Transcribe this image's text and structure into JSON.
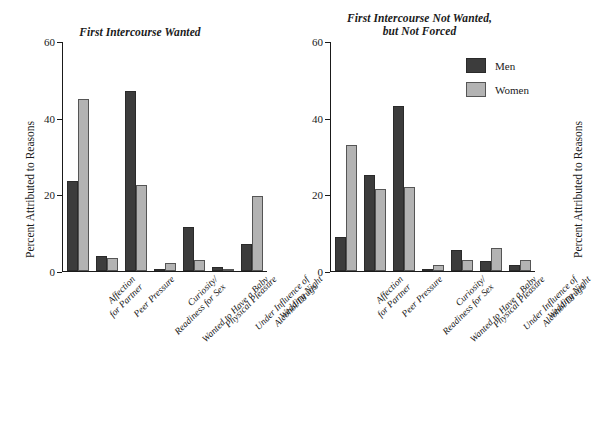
{
  "figure": {
    "y_axis_label": "Percent Attributed to Reasons",
    "legend": {
      "men_label": "Men",
      "women_label": "Women",
      "men_color": "#3c3c3c",
      "women_color": "#b3b3b3"
    }
  },
  "chart_data": [
    {
      "type": "bar",
      "title": "First Intercourse Wanted",
      "xlabel": "",
      "ylabel": "Percent Attributed to Reasons",
      "ylim": [
        0,
        60
      ],
      "yticks": [
        0,
        20,
        40,
        60
      ],
      "grid": false,
      "legend_position": "outside-right",
      "categories": [
        "Affection\nfor Partner",
        "Peer Pressure",
        "Curiosity/\nReadiness for Sex",
        "Wanted to Have a Baby",
        "Physical Pleasure",
        "Under Influence of\nAlcohol/Drugs",
        "Wedding Night"
      ],
      "series": [
        {
          "name": "Men",
          "color": "#3c3c3c",
          "values": [
            23.5,
            4.0,
            47.0,
            0.5,
            11.5,
            1.0,
            7.0
          ]
        },
        {
          "name": "Women",
          "color": "#b3b3b3",
          "values": [
            45.0,
            3.5,
            22.5,
            2.0,
            3.0,
            0.5,
            19.5
          ]
        }
      ]
    },
    {
      "type": "bar",
      "title": "First Intercourse Not Wanted,\nbut Not Forced",
      "xlabel": "",
      "ylabel": "Percent Attributed to Reasons",
      "ylim": [
        0,
        60
      ],
      "yticks": [
        0,
        20,
        40,
        60
      ],
      "grid": false,
      "legend_position": "outside-right",
      "categories": [
        "Affection\nfor Partner",
        "Peer Pressure",
        "Curiosity/\nReadiness for Sex",
        "Wanted to Have a Baby",
        "Physical Pleasure",
        "Under Influence of\nAlcohol/Drugs",
        "Wedding Night"
      ],
      "series": [
        {
          "name": "Men",
          "color": "#3c3c3c",
          "values": [
            9.0,
            25.0,
            43.0,
            0.5,
            5.5,
            2.5,
            1.5
          ]
        },
        {
          "name": "Women",
          "color": "#b3b3b3",
          "values": [
            33.0,
            21.5,
            22.0,
            1.5,
            3.0,
            6.0,
            3.0
          ]
        }
      ]
    }
  ]
}
